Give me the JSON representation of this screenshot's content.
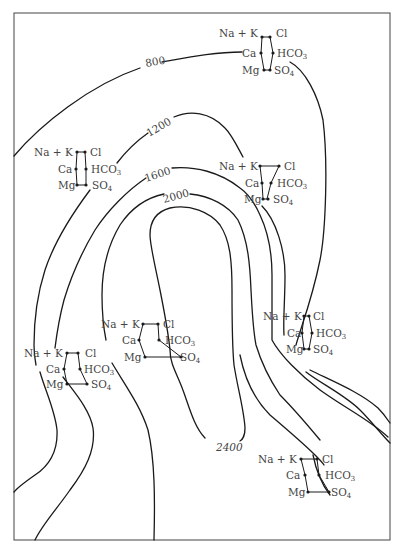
{
  "figure": {
    "type": "hydrochemical contour map with Stiff diagrams",
    "frame": {
      "x": 14,
      "y": 13,
      "width": 376,
      "height": 527
    }
  },
  "ions": {
    "left": [
      "Na + K",
      "Ca",
      "Mg"
    ],
    "right_cl": "Cl",
    "right_hco3": "HCO",
    "right_hco3_sub": "3",
    "right_so4": "SO",
    "right_so4_sub": "4"
  },
  "contours": [
    {
      "value": "800",
      "label": "800"
    },
    {
      "value": "1200",
      "label": "1200"
    },
    {
      "value": "1600",
      "label": "1600"
    },
    {
      "value": "2000",
      "label": "2000"
    },
    {
      "value": "2400",
      "label": "2400"
    }
  ],
  "stiff_diagrams": [
    {
      "id": "top-right",
      "label_x": 262,
      "label_y": 36
    },
    {
      "id": "upper-left",
      "label_x": 36,
      "label_y": 155
    },
    {
      "id": "center-right",
      "label_x": 218,
      "label_y": 168
    },
    {
      "id": "middle-center",
      "label_x": 102,
      "label_y": 326
    },
    {
      "id": "right-middle",
      "label_x": 264,
      "label_y": 318
    },
    {
      "id": "lower-left",
      "label_x": 24,
      "label_y": 355
    },
    {
      "id": "bottom-right",
      "label_x": 258,
      "label_y": 460
    }
  ]
}
